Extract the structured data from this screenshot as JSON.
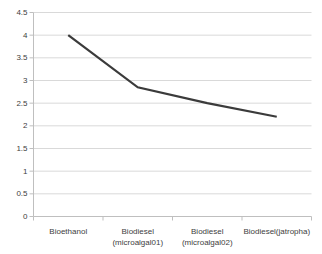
{
  "chart_data": {
    "type": "line",
    "title": "",
    "xlabel": "",
    "ylabel": "",
    "categories": [
      "Bioethanol",
      "Biodiesel (microalgal01)",
      "Biodiesel (microalgal02)",
      "Biodiesel(jatropha)"
    ],
    "category_label_lines": [
      [
        "Bioethanol"
      ],
      [
        "Biodiesel",
        "(microalgal01)"
      ],
      [
        "Biodiesel",
        "(microalgal02)"
      ],
      [
        "Biodiesel(jatropha)"
      ]
    ],
    "series": [
      {
        "name": "",
        "values": [
          4,
          2.85,
          2.5,
          2.2
        ]
      }
    ],
    "ylim": [
      0,
      4.5
    ],
    "ytick_step": 0.5,
    "ytick_labels": [
      "0",
      "0.5",
      "1",
      "1.5",
      "2",
      "2.5",
      "3",
      "3.5",
      "4",
      "4.5"
    ],
    "grid": true,
    "legend": false,
    "markers": false,
    "colors": {
      "line": "#3b3b3b",
      "gridline": "#d9d9d9",
      "axis": "#bfbfbf",
      "tick": "#bfbfbf",
      "text": "#404040",
      "background": "#ffffff"
    }
  }
}
